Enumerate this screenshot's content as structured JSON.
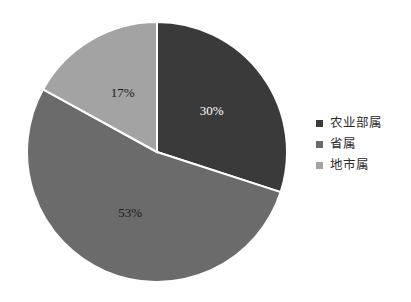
{
  "chart_data": {
    "type": "pie",
    "title": "",
    "categories": [
      "农业部属",
      "省属",
      "地市属"
    ],
    "values": [
      30,
      53,
      17
    ],
    "data_labels": [
      "30%",
      "53%",
      "17%"
    ],
    "colors": [
      "#3a3a3a",
      "#6b6b6b",
      "#a3a3a3"
    ],
    "label_colors": [
      "#ffffff",
      "#1a1a1a",
      "#1a1a1a"
    ],
    "slice_border_color": "#ffffff",
    "start_angle_deg": 0,
    "direction": "clockwise",
    "legend": {
      "position": "right",
      "entries": [
        {
          "label": "农业部属",
          "color": "#3a3a3a",
          "value": 30
        },
        {
          "label": "省属",
          "color": "#6b6b6b",
          "value": 53
        },
        {
          "label": "地市属",
          "color": "#a3a3a3",
          "value": 17
        }
      ]
    },
    "background": "#ffffff",
    "grid": false
  },
  "geometry": {
    "center_x": 130,
    "center_y": 130,
    "radius": 130
  }
}
